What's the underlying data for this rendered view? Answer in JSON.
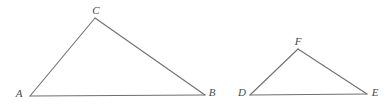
{
  "figure": {
    "background_color": "#ffffff",
    "stroke_color": "#707070",
    "label_color": "#4a4a4a",
    "stroke_width": 1.1,
    "canvas": {
      "width": 392,
      "height": 105
    }
  },
  "shapes": [
    {
      "name": "triangle-abc",
      "vertices": [
        {
          "label": "A",
          "x": 30,
          "y": 96,
          "label_x": 19,
          "label_y": 97
        },
        {
          "label": "B",
          "x": 205,
          "y": 95,
          "label_x": 210,
          "label_y": 96
        },
        {
          "label": "C",
          "x": 95,
          "y": 18,
          "label_x": 93,
          "label_y": 14
        }
      ],
      "edges": [
        {
          "name": "edge-ac",
          "from": "A",
          "to": "C"
        },
        {
          "name": "edge-cb",
          "from": "C",
          "to": "B"
        },
        {
          "name": "edge-ab",
          "from": "A",
          "to": "B"
        }
      ]
    },
    {
      "name": "triangle-def",
      "vertices": [
        {
          "label": "D",
          "x": 250,
          "y": 95,
          "label_x": 241,
          "label_y": 96
        },
        {
          "label": "E",
          "x": 367,
          "y": 94,
          "label_x": 372,
          "label_y": 96
        },
        {
          "label": "F",
          "x": 298,
          "y": 49,
          "label_x": 295,
          "label_y": 45
        }
      ],
      "edges": [
        {
          "name": "edge-df",
          "from": "D",
          "to": "F"
        },
        {
          "name": "edge-fe",
          "from": "F",
          "to": "E"
        },
        {
          "name": "edge-de",
          "from": "D",
          "to": "E"
        }
      ]
    }
  ],
  "labels": {
    "a": "A",
    "b": "B",
    "c": "C",
    "d": "D",
    "e": "E",
    "f": "F"
  }
}
